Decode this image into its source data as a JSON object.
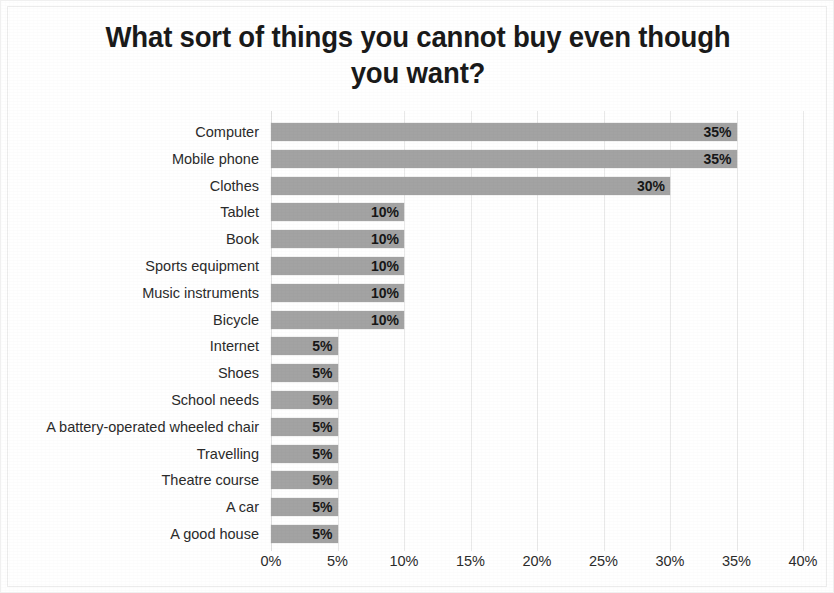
{
  "chart_data": {
    "type": "bar",
    "orientation": "horizontal",
    "title": "What sort of things you cannot buy even though you want?",
    "title_line1": "What sort of things you cannot buy even though",
    "title_line2": "you want?",
    "xlabel": "",
    "ylabel": "",
    "xlim": [
      0,
      40
    ],
    "xticks": [
      "0%",
      "5%",
      "10%",
      "15%",
      "20%",
      "25%",
      "30%",
      "35%",
      "40%"
    ],
    "xtick_values": [
      0,
      5,
      10,
      15,
      20,
      25,
      30,
      35,
      40
    ],
    "grid": true,
    "grid_axis": "x",
    "legend": false,
    "bar_color": "#a3a3a3",
    "label_color": "#2b2b2b",
    "value_label_position": "inside-end",
    "categories": [
      "Computer",
      "Mobile phone",
      "Clothes",
      "Tablet",
      "Book",
      "Sports equipment",
      "Music instruments",
      "Bicycle",
      "Internet",
      "Shoes",
      "School needs",
      "A battery-operated wheeled chair",
      "Travelling",
      "Theatre course",
      "A car",
      "A good house"
    ],
    "values": [
      35,
      35,
      30,
      10,
      10,
      10,
      10,
      10,
      5,
      5,
      5,
      5,
      5,
      5,
      5,
      5
    ],
    "value_labels": [
      "35%",
      "35%",
      "30%",
      "10%",
      "10%",
      "10%",
      "10%",
      "10%",
      "5%",
      "5%",
      "5%",
      "5%",
      "5%",
      "5%",
      "5%",
      "5%"
    ]
  }
}
